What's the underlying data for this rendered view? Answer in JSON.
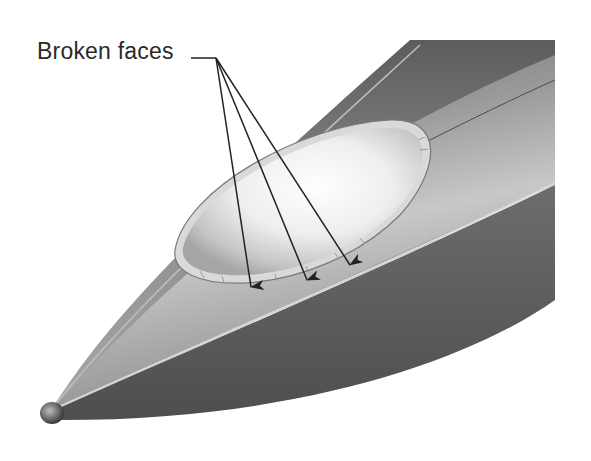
{
  "figure": {
    "annotation_label": "Broken faces",
    "callout_count": 3,
    "colors": {
      "background": "#ffffff",
      "body_dark": "#5a5a5a",
      "body_mid": "#8a8a8a",
      "body_light": "#cfcfcf",
      "canopy": "#e8e8e8",
      "arrow": "#222222",
      "text": "#2a2a2a"
    }
  }
}
